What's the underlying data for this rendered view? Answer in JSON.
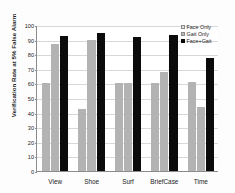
{
  "chart_data": {
    "type": "bar",
    "title": "",
    "xlabel": "",
    "ylabel": "Verification Rate at 5% False Alarm",
    "ylim": [
      0,
      100
    ],
    "ytick_step": 10,
    "yticks": [
      0,
      10,
      20,
      30,
      40,
      50,
      60,
      70,
      80,
      90,
      100
    ],
    "grid": true,
    "legend_position": "top-right",
    "categories": [
      "View",
      "Shoe",
      "Surf",
      "BriefCase",
      "Time"
    ],
    "series": [
      {
        "name": "Face Only",
        "color": "#b3b3b3",
        "values": [
          60,
          42.5,
          60.5,
          60,
          61
        ]
      },
      {
        "name": "Gait Only",
        "color": "#b3b3b3",
        "values": [
          87,
          90,
          60.5,
          68,
          44
        ]
      },
      {
        "name": "Face+Gait",
        "color": "#0b0b0b",
        "values": [
          92.5,
          94.5,
          92,
          93.5,
          77.5
        ]
      }
    ]
  },
  "legend": {
    "entries": [
      {
        "label": "Face Only",
        "swatch": "sw-face-only"
      },
      {
        "label": "Gait Only",
        "swatch": "sw-gait-only"
      },
      {
        "label": "Face+Gait",
        "swatch": "sw-face-gait"
      }
    ]
  }
}
